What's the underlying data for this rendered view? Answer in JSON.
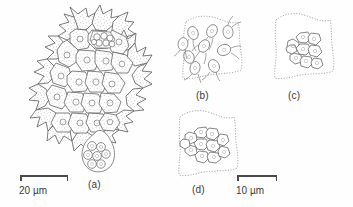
{
  "figure": {
    "type": "scientific-line-drawing",
    "background_color": "#fefefe",
    "ink_color": "#555555",
    "stipple_color": "#8a8a8a",
    "label_color": "#3a3a3a"
  },
  "panels": [
    {
      "id": "a",
      "label": "(a)",
      "description": "Whole spiny coenobium (flat colony) of polygonal cells each bearing horn-like marginal spines, with a daughter-colony vesicle emerging at lower right containing rounded autospores",
      "cell_count_visible": 18,
      "marginal_spine_count": 22,
      "vesicle_spore_count": 7,
      "stipple": true
    },
    {
      "id": "b",
      "label": "(b)",
      "description": "Parent cell wall outline containing free-swimming biflagellate zoospores scattered in the vesicle",
      "zoospore_count": 9,
      "flagella_per_cell": 2,
      "stipple": false
    },
    {
      "id": "c",
      "label": "(c)",
      "description": "Parent cell wall outline enclosing zoospores aggregated into a compact rosette of a young flat coenobium",
      "cell_count": 9,
      "stipple": false
    },
    {
      "id": "d",
      "label": "(d)",
      "description": "Parent cell wall outline enclosing a slightly larger, fully organised daughter coenobium",
      "cell_count": 11,
      "stipple": false
    }
  ],
  "scale_bars": [
    {
      "id": "scale-a",
      "value": "20",
      "unit": "µm",
      "text": "20 µm",
      "applies_to": "a",
      "length_px": 48
    },
    {
      "id": "scale-bcd",
      "value": "10",
      "unit": "µm",
      "text": "10 µm",
      "applies_to": "b, c, d",
      "length_px": 40
    }
  ]
}
